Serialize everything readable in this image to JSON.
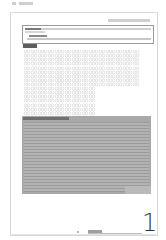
{
  "document": {
    "type": "scanned form page",
    "page_number": "1",
    "grid_glyph": "〇",
    "grid_rows_full": 9,
    "grid_rows_partial": 8,
    "grid_columns_full": 34,
    "grid_columns_partial": 21
  }
}
